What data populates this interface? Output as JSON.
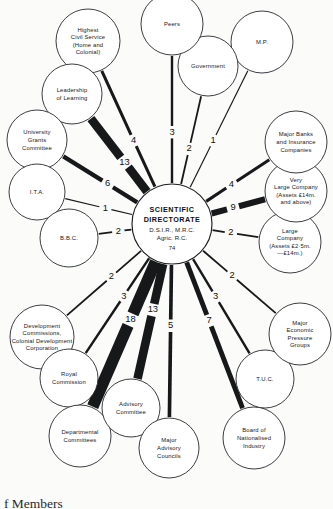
{
  "figure": {
    "caption": "f Members",
    "background_color": "#fbfbfa",
    "ink_color": "#17181a"
  },
  "hub": {
    "title_line1": "SCIENTIFIC",
    "title_line2": "DIRECTORATE",
    "subtitle_line1": "D.S.I.R., M.R.C.",
    "subtitle_line2": "Agric. R.C.",
    "count": "74",
    "cx": 172,
    "cy": 224,
    "r": 40
  },
  "chart_data": {
    "type": "diagram",
    "center": "SCIENTIFIC DIRECTORATE (D.S.I.R., M.R.C., Agric. R.C.) — 74",
    "value_encoding": "edge line thickness is proportional to number of members",
    "nodes": [
      {
        "id": "highest-civil-service",
        "lines": [
          "Highest",
          "Civil Service",
          "(Home and",
          "Colonial)"
        ],
        "value": 4,
        "cx": 88,
        "cy": 41,
        "r": 32
      },
      {
        "id": "leadership-of-learning",
        "lines": [
          "Leadership",
          "of Learning"
        ],
        "value": 13,
        "cx": 72,
        "cy": 94,
        "r": 30
      },
      {
        "id": "university-grants-committee",
        "lines": [
          "University",
          "Grants",
          "Committee"
        ],
        "value": 6,
        "cx": 37,
        "cy": 140,
        "r": 30
      },
      {
        "id": "ita",
        "lines": [
          "I.T.A."
        ],
        "value": 1,
        "cx": 37,
        "cy": 192,
        "r": 28
      },
      {
        "id": "bbc",
        "lines": [
          "B.B.C."
        ],
        "value": 2,
        "cx": 69,
        "cy": 238,
        "r": 29
      },
      {
        "id": "development-commissions",
        "lines": [
          "Development",
          "Commissions,",
          "Colonial Development",
          "Corporation"
        ],
        "value": 2,
        "cx": 42,
        "cy": 337,
        "r": 32
      },
      {
        "id": "royal-commission",
        "lines": [
          "Royal",
          "Commission"
        ],
        "value": 3,
        "cx": 69,
        "cy": 378,
        "r": 29
      },
      {
        "id": "departmental-committees",
        "lines": [
          "Departmental",
          "Committees"
        ],
        "value": 18,
        "cx": 80,
        "cy": 436,
        "r": 31
      },
      {
        "id": "advisory-committee",
        "lines": [
          "Advisory",
          "Committee"
        ],
        "value": 13,
        "cx": 131,
        "cy": 408,
        "r": 29
      },
      {
        "id": "major-advisory-councils",
        "lines": [
          "Major",
          "Advisory",
          "Councils"
        ],
        "value": 5,
        "cx": 169,
        "cy": 448,
        "r": 30
      },
      {
        "id": "board-of-nationalised-industry",
        "lines": [
          "Board of",
          "Nationalised",
          "Industry"
        ],
        "value": 7,
        "cx": 254,
        "cy": 438,
        "r": 31
      },
      {
        "id": "tuc",
        "lines": [
          "T.U.C."
        ],
        "value": 3,
        "cx": 265,
        "cy": 379,
        "r": 29
      },
      {
        "id": "major-economic-pressure-groups",
        "lines": [
          "Major",
          "Economic",
          "Pressure",
          "Groups"
        ],
        "value": 2,
        "cx": 300,
        "cy": 334,
        "r": 31
      },
      {
        "id": "large-company",
        "lines": [
          "Large",
          "Company",
          "(Assets £2·5m.",
          "—£14m.)"
        ],
        "value": 2,
        "cx": 290,
        "cy": 242,
        "r": 31
      },
      {
        "id": "very-large-company",
        "lines": [
          "Very",
          "Large Company",
          "(Assets £14m.",
          "and above)"
        ],
        "value": 9,
        "cx": 296,
        "cy": 191,
        "r": 31
      },
      {
        "id": "major-banks-and-insurance",
        "lines": [
          "Major Banks",
          "and Insurance",
          "Companies"
        ],
        "value": 4,
        "cx": 296,
        "cy": 142,
        "r": 31
      },
      {
        "id": "mp",
        "lines": [
          "M.P."
        ],
        "value": 1,
        "cx": 262,
        "cy": 42,
        "r": 31
      },
      {
        "id": "government",
        "lines": [
          "Government"
        ],
        "value": 2,
        "cx": 208,
        "cy": 66,
        "r": 30
      },
      {
        "id": "peers",
        "lines": [
          "Peers"
        ],
        "value": 3,
        "cx": 172,
        "cy": 24,
        "r": 31
      }
    ]
  }
}
